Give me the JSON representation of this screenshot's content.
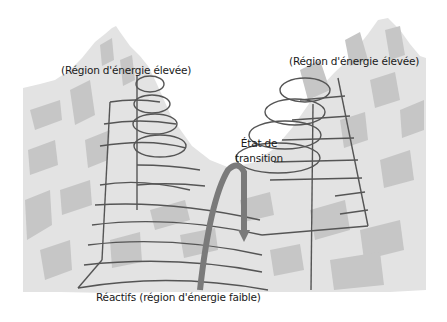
{
  "diagram": {
    "labels": {
      "high_energy_left": "(Région d'énergie élevée)",
      "high_energy_right": "(Région d'énergie élevée)",
      "transition_state_line1": "État de",
      "transition_state_line2": "transition",
      "reactants": "Réactifs (région d'énergie faible)"
    },
    "colors": {
      "mountain_light": "#e2e2e2",
      "mountain_dark": "#c4c4c4",
      "contour_lines": "#555555",
      "arrow": "#7a7a7a",
      "background": "#ffffff"
    }
  }
}
